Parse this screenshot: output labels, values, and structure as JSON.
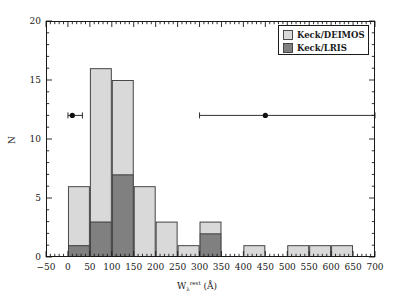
{
  "chart_data": {
    "type": "bar",
    "title": "",
    "subtitle": "",
    "xlabel": "W_lambda^rest (Å)",
    "xlabel_parts": {
      "base": "W",
      "sub": "λ",
      "sup": "rest",
      "unit": "(Å)"
    },
    "ylabel": "N",
    "xlim": [
      -50,
      700
    ],
    "ylim": [
      0,
      20
    ],
    "xticks": [
      -50,
      0,
      50,
      100,
      150,
      200,
      250,
      300,
      350,
      400,
      450,
      500,
      550,
      600,
      650,
      700
    ],
    "xticklabels": [
      "−50",
      "0",
      "50",
      "100",
      "150",
      "200",
      "250",
      "300",
      "350",
      "400",
      "450",
      "500",
      "550",
      "600",
      "650",
      "700"
    ],
    "yticks": [
      0,
      5,
      10,
      15,
      20
    ],
    "yticklabels": [
      "0",
      "5",
      "10",
      "15",
      "20"
    ],
    "xminor_step": 10,
    "yminor_step": 1,
    "grid": false,
    "bin_width": 50,
    "bin_edges": [
      0,
      50,
      100,
      150,
      200,
      250,
      300,
      350,
      400,
      450,
      500,
      550,
      600,
      650
    ],
    "stacked": true,
    "series": [
      {
        "name": "Keck/DEIMOS",
        "color": "#d9d9d9",
        "values": [
          5,
          13,
          8,
          6,
          3,
          1,
          1,
          0,
          1,
          0,
          1,
          1,
          1
        ]
      },
      {
        "name": "Keck/LRIS",
        "color": "#808080",
        "values": [
          1,
          3,
          7,
          0,
          0,
          0,
          2,
          0,
          0,
          0,
          0,
          0,
          0
        ]
      }
    ],
    "totals": [
      6,
      16,
      15,
      6,
      3,
      1,
      3,
      0,
      1,
      0,
      1,
      1,
      1
    ],
    "legend_position": "top-right",
    "annotations": [
      {
        "type": "errorbar",
        "name": "errorbar-left",
        "x": 10,
        "y": 12,
        "xerr_low": 10,
        "xerr_high": 23
      },
      {
        "type": "errorbar",
        "name": "errorbar-right",
        "x": 450,
        "y": 12,
        "xerr_low": 150,
        "xerr_high": 250
      }
    ]
  },
  "legend": {
    "items": [
      {
        "label": "Keck/DEIMOS",
        "swatch": "#d9d9d9"
      },
      {
        "label": "Keck/LRIS",
        "swatch": "#808080"
      }
    ]
  },
  "colors": {
    "deimos": "#d9d9d9",
    "lris": "#808080",
    "frame": "#1a1a1a",
    "background": "#ffffff"
  }
}
